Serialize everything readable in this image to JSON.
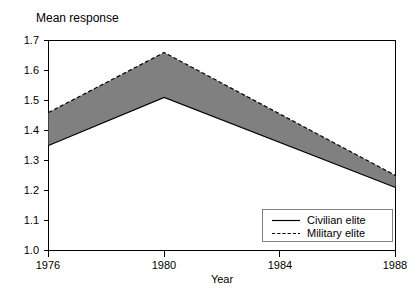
{
  "chart_data": {
    "type": "area",
    "title": "Mean response",
    "xlabel": "Year",
    "ylabel": "",
    "x": [
      1976,
      1980,
      1988
    ],
    "xlim": [
      1976,
      1988
    ],
    "ylim": [
      1.0,
      1.7
    ],
    "x_ticks": [
      1976,
      1980,
      1984,
      1988
    ],
    "x_tick_labels": [
      "1976",
      "1980",
      "1984",
      "1988"
    ],
    "y_ticks": [
      1.0,
      1.1,
      1.2,
      1.3,
      1.4,
      1.5,
      1.6,
      1.7
    ],
    "y_tick_labels": [
      "1.0",
      "1.1",
      "1.2",
      "1.3",
      "1.4",
      "1.5",
      "1.6",
      "1.7"
    ],
    "grid": false,
    "legend_position": "bottom-right",
    "band_fill_color": "#808080",
    "line_color": "#000000",
    "series": [
      {
        "name": "Civilian elite",
        "style": "solid",
        "values": [
          1.35,
          1.51,
          1.21
        ]
      },
      {
        "name": "Military elite",
        "style": "dashed",
        "values": [
          1.46,
          1.66,
          1.25
        ]
      }
    ]
  },
  "legend": {
    "items": [
      {
        "label": "Civilian elite",
        "style": "solid"
      },
      {
        "label": "Military elite",
        "style": "dashed"
      }
    ]
  },
  "labels": {
    "title": "Mean response",
    "xlabel": "Year",
    "y_0": "1.0",
    "y_1": "1.1",
    "y_2": "1.2",
    "y_3": "1.3",
    "y_4": "1.4",
    "y_5": "1.5",
    "y_6": "1.6",
    "y_7": "1.7",
    "x_0": "1976",
    "x_1": "1980",
    "x_2": "1984",
    "x_3": "1988",
    "legend_0": "Civilian elite",
    "legend_1": "Military elite"
  }
}
